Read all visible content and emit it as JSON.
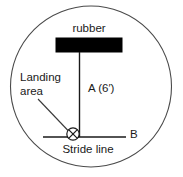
{
  "diagram": {
    "background_color": "#ffffff",
    "boundary": {
      "shape": "circle",
      "stroke_color": "#4a4a4a"
    },
    "rubber": {
      "label": "rubber",
      "fill_color": "#000000"
    },
    "landing": {
      "label_line1": "Landing",
      "label_line2": "area",
      "marker_symbol": "X"
    },
    "measurement": {
      "label": "A  (6′)",
      "letter": "A",
      "value": "6′"
    },
    "stride": {
      "label": "Stride line",
      "endpoint_label": "B"
    }
  }
}
